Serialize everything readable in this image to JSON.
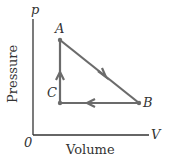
{
  "diagram": {
    "type": "pV cycle",
    "axes": {
      "y_symbol": "p",
      "x_symbol": "V",
      "origin": "0",
      "y_label": "Pressure",
      "x_label": "Volume"
    },
    "points": {
      "A": "A",
      "B": "B",
      "C": "C"
    },
    "process_order": [
      "A→B",
      "B→C",
      "C→A"
    ],
    "line_color": "#6b6b6b",
    "axis_color": "#333333"
  }
}
